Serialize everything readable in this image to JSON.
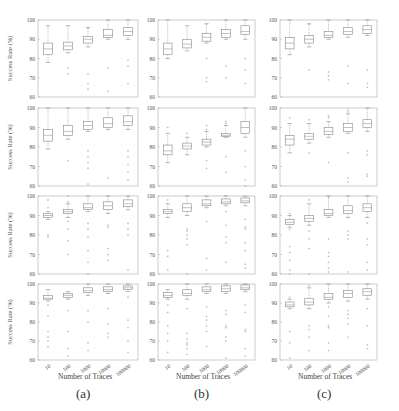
{
  "figure": {
    "captions": [
      "(a)",
      "(b)",
      "(c)"
    ],
    "xlabel": "Number of Traces",
    "ylabel": "Success Rate (%)",
    "xticks": [
      "10",
      "100",
      "1000",
      "10000",
      "100000"
    ],
    "yticks": [
      60,
      70,
      80,
      90,
      100
    ],
    "colors": {
      "axis": "#aaaaaa",
      "box": "#888888",
      "median": "#999999",
      "outlier": "#aaaaaa"
    }
  },
  "chart_data": {
    "type": "boxplot",
    "values_are_estimates": true,
    "note": "Tick labels, axis labels and captions are read from the image. Box-plot statistics (median, q1, q3, whisker_low, whisker_high, outliers) are rough visual estimates; the boxes are only a few pixels tall at this resolution.",
    "title": "",
    "xlabel": "Number of Traces",
    "ylabel": "Success Rate (%)",
    "ylim": [
      60,
      100
    ],
    "categories": [
      "10",
      "100",
      "1000",
      "10000",
      "100000"
    ],
    "grid": false,
    "layout": {
      "rows": 4,
      "cols": 3,
      "col_captions": [
        "(a)",
        "(b)",
        "(c)"
      ]
    },
    "panels": [
      {
        "row": 0,
        "col": 0,
        "boxes": [
          {
            "median": 85,
            "q1": 82,
            "q3": 88,
            "whisker_low": 78,
            "whisker_high": 97,
            "outliers": []
          },
          {
            "median": 86.5,
            "q1": 84.5,
            "q3": 88.5,
            "whisker_low": 83,
            "whisker_high": 97,
            "outliers": [
              75,
              72
            ]
          },
          {
            "median": 90,
            "q1": 88,
            "q3": 91.5,
            "whisker_low": 86,
            "whisker_high": 96,
            "outliers": [
              96,
              72,
              67,
              64
            ]
          },
          {
            "median": 92,
            "q1": 91,
            "q3": 95,
            "whisker_low": 90,
            "whisker_high": 100,
            "outliers": [
              75,
              63
            ]
          },
          {
            "median": 94,
            "q1": 92,
            "q3": 96,
            "whisker_low": 90,
            "whisker_high": 100,
            "outliers": [
              79,
              76,
              67
            ]
          }
        ]
      },
      {
        "row": 0,
        "col": 1,
        "boxes": [
          {
            "median": 85,
            "q1": 82,
            "q3": 88,
            "whisker_low": 80,
            "whisker_high": 100,
            "outliers": []
          },
          {
            "median": 87.5,
            "q1": 85.5,
            "q3": 90,
            "whisker_low": 84,
            "whisker_high": 97,
            "outliers": []
          },
          {
            "median": 91,
            "q1": 89,
            "q3": 93,
            "whisker_low": 88,
            "whisker_high": 98,
            "outliers": [
              98,
              80,
              70,
              68
            ]
          },
          {
            "median": 93,
            "q1": 91,
            "q3": 95,
            "whisker_low": 90,
            "whisker_high": 100,
            "outliers": [
              76,
              70
            ]
          },
          {
            "median": 94,
            "q1": 92.5,
            "q3": 97,
            "whisker_low": 90,
            "whisker_high": 100,
            "outliers": [
              80,
              74,
              67
            ]
          }
        ]
      },
      {
        "row": 0,
        "col": 2,
        "boxes": [
          {
            "median": 88,
            "q1": 85,
            "q3": 91,
            "whisker_low": 82,
            "whisker_high": 100,
            "outliers": []
          },
          {
            "median": 90,
            "q1": 88,
            "q3": 92,
            "whisker_low": 86,
            "whisker_high": 98,
            "outliers": [
              98,
              74
            ]
          },
          {
            "median": 92,
            "q1": 91,
            "q3": 94,
            "whisker_low": 90,
            "whisker_high": 100,
            "outliers": [
              73,
              71,
              69
            ]
          },
          {
            "median": 94,
            "q1": 92.5,
            "q3": 96,
            "whisker_low": 91,
            "whisker_high": 100,
            "outliers": [
              76,
              67
            ]
          },
          {
            "median": 95,
            "q1": 93,
            "q3": 97,
            "whisker_low": 92,
            "whisker_high": 100,
            "outliers": [
              74,
              67,
              65
            ]
          }
        ]
      },
      {
        "row": 1,
        "col": 0,
        "boxes": [
          {
            "median": 86,
            "q1": 83,
            "q3": 89,
            "whisker_low": 79,
            "whisker_high": 100,
            "outliers": []
          },
          {
            "median": 88,
            "q1": 86,
            "q3": 91,
            "whisker_low": 84,
            "whisker_high": 100,
            "outliers": [
              73
            ]
          },
          {
            "median": 91,
            "q1": 89,
            "q3": 93,
            "whisker_low": 88,
            "whisker_high": 100,
            "outliers": [
              78,
              75,
              72,
              69,
              61
            ]
          },
          {
            "median": 92,
            "q1": 90,
            "q3": 95,
            "whisker_low": 89,
            "whisker_high": 100,
            "outliers": [
              64
            ]
          },
          {
            "median": 93,
            "q1": 91,
            "q3": 96,
            "whisker_low": 89,
            "whisker_high": 100,
            "outliers": [
              78,
              75,
              71,
              67,
              63
            ]
          }
        ]
      },
      {
        "row": 1,
        "col": 1,
        "boxes": [
          {
            "median": 78,
            "q1": 76,
            "q3": 81,
            "whisker_low": 72,
            "whisker_high": 87,
            "outliers": [
              90
            ]
          },
          {
            "median": 80.5,
            "q1": 79,
            "q3": 82,
            "whisker_low": 76,
            "whisker_high": 85,
            "outliers": [
              87
            ]
          },
          {
            "median": 82.5,
            "q1": 81,
            "q3": 84,
            "whisker_low": 80,
            "whisker_high": 88,
            "outliers": [
              91,
              89,
              73,
              69
            ]
          },
          {
            "median": 86,
            "q1": 85.5,
            "q3": 87,
            "whisker_low": 85,
            "whisker_high": 91,
            "outliers": [
              93,
              92,
              75,
              67
            ]
          },
          {
            "median": 90,
            "q1": 87,
            "q3": 93,
            "whisker_low": 85,
            "whisker_high": 100,
            "outliers": [
              78,
              70,
              63,
              60
            ]
          }
        ]
      },
      {
        "row": 1,
        "col": 2,
        "boxes": [
          {
            "median": 84,
            "q1": 81,
            "q3": 86,
            "whisker_low": 77,
            "whisker_high": 92,
            "outliers": [
              95
            ]
          },
          {
            "median": 85.5,
            "q1": 84,
            "q3": 87,
            "whisker_low": 82,
            "whisker_high": 92,
            "outliers": [
              94,
              77
            ]
          },
          {
            "median": 88,
            "q1": 86.5,
            "q3": 90,
            "whisker_low": 85,
            "whisker_high": 93,
            "outliers": [
              96,
              95,
              72
            ]
          },
          {
            "median": 90,
            "q1": 88,
            "q3": 92,
            "whisker_low": 87,
            "whisker_high": 97,
            "outliers": [
              99,
              98,
              77,
              64,
              62
            ]
          },
          {
            "median": 92,
            "q1": 90,
            "q3": 94,
            "whisker_low": 88,
            "whisker_high": 100,
            "outliers": [
              78,
              76,
              66,
              65
            ]
          }
        ]
      },
      {
        "row": 2,
        "col": 0,
        "boxes": [
          {
            "median": 90,
            "q1": 89,
            "q3": 91,
            "whisker_low": 88,
            "whisker_high": 92,
            "outliers": [
              94,
              98,
              80,
              79
            ]
          },
          {
            "median": 92,
            "q1": 91,
            "q3": 93,
            "whisker_low": 89,
            "whisker_high": 96,
            "outliers": [
              100,
              97,
              87,
              83,
              77,
              70
            ]
          },
          {
            "median": 94,
            "q1": 93,
            "q3": 96,
            "whisker_low": 92,
            "whisker_high": 100,
            "outliers": [
              86,
              83,
              79,
              72,
              66,
              60
            ]
          },
          {
            "median": 95,
            "q1": 93,
            "q3": 97,
            "whisker_low": 91,
            "whisker_high": 100,
            "outliers": [
              85,
              84,
              73,
              70,
              67
            ]
          },
          {
            "median": 96,
            "q1": 94.5,
            "q3": 98,
            "whisker_low": 93,
            "whisker_high": 100,
            "outliers": [
              86,
              83,
              80,
              62
            ]
          }
        ]
      },
      {
        "row": 2,
        "col": 1,
        "boxes": [
          {
            "median": 92,
            "q1": 91,
            "q3": 93,
            "whisker_low": 89,
            "whisker_high": 96,
            "outliers": [
              98,
              72,
              69,
              62
            ]
          },
          {
            "median": 94,
            "q1": 92,
            "q3": 96,
            "whisker_low": 90,
            "whisker_high": 100,
            "outliers": [
              83,
              82,
              80,
              78,
              75,
              60
            ]
          },
          {
            "median": 96,
            "q1": 95,
            "q3": 98,
            "whisker_low": 94,
            "whisker_high": 100,
            "outliers": [
              87,
              68,
              62
            ]
          },
          {
            "median": 97,
            "q1": 96,
            "q3": 98.5,
            "whisker_low": 95,
            "whisker_high": 100,
            "outliers": [
              92,
              85,
              79,
              76,
              66
            ]
          },
          {
            "median": 97.5,
            "q1": 96.5,
            "q3": 99,
            "whisker_low": 95,
            "whisker_high": 100,
            "outliers": [
              88,
              84,
              83,
              76,
              72,
              65,
              63
            ]
          }
        ]
      },
      {
        "row": 2,
        "col": 2,
        "boxes": [
          {
            "median": 86.5,
            "q1": 85.5,
            "q3": 88,
            "whisker_low": 84,
            "whisker_high": 90,
            "outliers": [
              91,
              83,
              74,
              71,
              67,
              62,
              60
            ]
          },
          {
            "median": 88.5,
            "q1": 87,
            "q3": 90,
            "whisker_low": 85,
            "whisker_high": 96,
            "outliers": [
              98,
              82,
              78,
              73,
              60
            ]
          },
          {
            "median": 91,
            "q1": 90,
            "q3": 93,
            "whisker_low": 89,
            "whisker_high": 100,
            "outliers": [
              99,
              78,
              71,
              69,
              66,
              63,
              61
            ]
          },
          {
            "median": 92.5,
            "q1": 91,
            "q3": 95,
            "whisker_low": 89,
            "whisker_high": 100,
            "outliers": [
              82,
              80,
              78,
              61
            ]
          },
          {
            "median": 94,
            "q1": 92,
            "q3": 96,
            "whisker_low": 89,
            "whisker_high": 100,
            "outliers": [
              86,
              78,
              75,
              66,
              62
            ]
          }
        ]
      },
      {
        "row": 3,
        "col": 0,
        "boxes": [
          {
            "median": 92.5,
            "q1": 92,
            "q3": 94,
            "whisker_low": 91,
            "whisker_high": 97,
            "outliers": [
              89,
              83,
              75,
              72,
              70,
              67
            ]
          },
          {
            "median": 94,
            "q1": 93,
            "q3": 95,
            "whisker_low": 92,
            "whisker_high": 96,
            "outliers": [
              86,
              75,
              66,
              62
            ]
          },
          {
            "median": 96.5,
            "q1": 95.5,
            "q3": 98,
            "whisker_low": 94,
            "whisker_high": 100,
            "outliers": [
              86,
              80,
              69,
              65
            ]
          },
          {
            "median": 97,
            "q1": 96,
            "q3": 98.5,
            "whisker_low": 95,
            "whisker_high": 100,
            "outliers": [
              87,
              79,
              74,
              72
            ]
          },
          {
            "median": 98,
            "q1": 97,
            "q3": 99,
            "whisker_low": 96,
            "whisker_high": 100,
            "outliers": [
              93,
              81,
              77,
              70,
              64
            ]
          }
        ]
      },
      {
        "row": 3,
        "col": 1,
        "boxes": [
          {
            "median": 94,
            "q1": 93,
            "q3": 95.5,
            "whisker_low": 92,
            "whisker_high": 97,
            "outliers": [
              89,
              85,
              78,
              74,
              70,
              64
            ]
          },
          {
            "median": 95,
            "q1": 94,
            "q3": 97,
            "whisker_low": 92,
            "whisker_high": 100,
            "outliers": [
              87,
              74,
              71,
              69,
              68,
              66,
              63
            ]
          },
          {
            "median": 97,
            "q1": 96,
            "q3": 98.5,
            "whisker_low": 95,
            "whisker_high": 100,
            "outliers": [
              88,
              83,
              81,
              78,
              75,
              67
            ]
          },
          {
            "median": 97.5,
            "q1": 96,
            "q3": 99,
            "whisker_low": 95,
            "whisker_high": 100,
            "outliers": [
              86,
              84,
              78,
              77,
              72,
              70,
              61
            ]
          },
          {
            "median": 98,
            "q1": 97,
            "q3": 99.5,
            "whisker_low": 96,
            "whisker_high": 100,
            "outliers": [
              89,
              85,
              76,
              75,
              66,
              62
            ]
          }
        ]
      },
      {
        "row": 3,
        "col": 2,
        "boxes": [
          {
            "median": 89,
            "q1": 88,
            "q3": 90.5,
            "whisker_low": 87,
            "whisker_high": 92,
            "outliers": [
              93,
              75,
              69,
              61
            ]
          },
          {
            "median": 90.5,
            "q1": 89,
            "q3": 92.5,
            "whisker_low": 87,
            "whisker_high": 98,
            "outliers": [
              99,
              78,
              76,
              72,
              65
            ]
          },
          {
            "median": 93,
            "q1": 92,
            "q3": 95,
            "whisker_low": 90,
            "whisker_high": 100,
            "outliers": [
              88,
              83,
              78,
              77,
              69,
              65
            ]
          },
          {
            "median": 95,
            "q1": 93,
            "q3": 96.5,
            "whisker_low": 91,
            "whisker_high": 100,
            "outliers": [
              86,
              84,
              82,
              79,
              72
            ]
          },
          {
            "median": 96,
            "q1": 94,
            "q3": 97.5,
            "whisker_low": 92,
            "whisker_high": 100,
            "outliers": [
              87,
              78,
              68,
              66
            ]
          }
        ]
      }
    ]
  }
}
